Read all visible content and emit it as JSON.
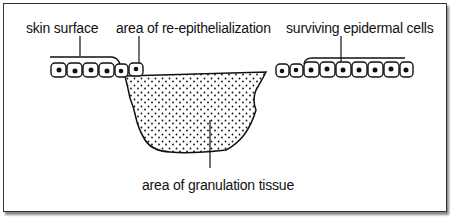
{
  "diagram": {
    "labels": {
      "skin_surface": "skin surface",
      "re_epithelialization": "area of re-epithelialization",
      "surviving_cells": "surviving epidermal cells",
      "granulation": "area of granulation tissue"
    },
    "colors": {
      "line": "#111111",
      "background": "#ffffff",
      "frame": "#333333"
    }
  }
}
